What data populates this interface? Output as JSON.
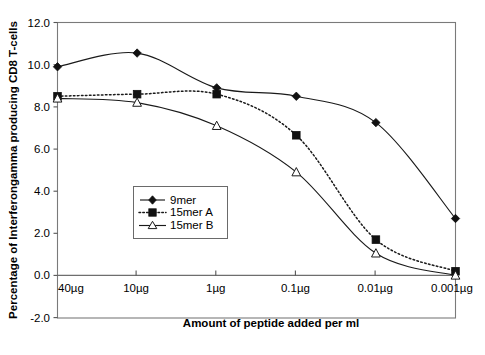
{
  "chart_data": {
    "type": "line",
    "title": "",
    "xlabel": "Amount of peptide added per ml",
    "ylabel": "Percentage of Interferongamma producing CD8 T-cells",
    "categories": [
      "40µg",
      "10µg",
      "1µg",
      "0.1µg",
      "0.01µg",
      "0.001µg"
    ],
    "series": [
      {
        "name": "9mer",
        "values": [
          9.9,
          10.55,
          8.9,
          8.5,
          7.25,
          2.7
        ],
        "marker": "diamond-filled",
        "line": "solid"
      },
      {
        "name": "15mer A",
        "values": [
          8.5,
          8.6,
          8.6,
          6.65,
          1.7,
          0.2
        ],
        "marker": "square-filled",
        "line": "dotted"
      },
      {
        "name": "15mer B",
        "values": [
          8.4,
          8.2,
          7.1,
          4.9,
          1.05,
          0.0
        ],
        "marker": "triangle-open",
        "line": "solid"
      }
    ],
    "ylim": [
      -2.0,
      12.0
    ],
    "yticks": [
      "12.0",
      "10.0",
      "8.0",
      "6.0",
      "4.0",
      "2.0",
      "0.0",
      "-2.0"
    ],
    "ytick_values": [
      12.0,
      10.0,
      8.0,
      6.0,
      4.0,
      2.0,
      0.0,
      -2.0
    ],
    "grid": false,
    "legend_position": "center"
  },
  "legend": {
    "entries": [
      {
        "label": "9mer"
      },
      {
        "label": "15mer A"
      },
      {
        "label": "15mer B"
      }
    ]
  }
}
